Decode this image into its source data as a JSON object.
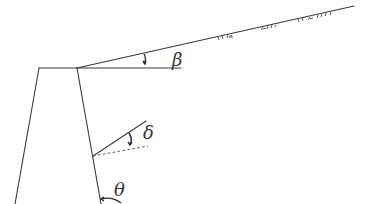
{
  "diagram": {
    "labels": {
      "beta": "β",
      "delta": "δ",
      "theta": "θ"
    },
    "angle_meanings": {
      "beta": "backfill slope angle",
      "delta": "wall friction angle",
      "theta": "wall back face inclination"
    },
    "colors": {
      "stroke": "#3a3a3a",
      "background": "#ffffff"
    }
  }
}
